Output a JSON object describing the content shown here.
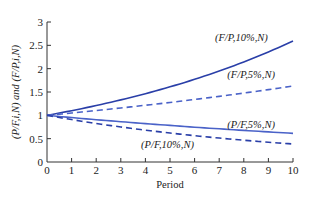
{
  "chart_data": {
    "type": "line",
    "title": "",
    "xlabel": "Period",
    "ylabel": "(P/F,i,N) and (F/P,i,N)",
    "xlim": [
      0,
      10
    ],
    "ylim": [
      0,
      3
    ],
    "grid": false,
    "legend": "inline labels",
    "x_ticks": [
      "0",
      "1",
      "2",
      "3",
      "4",
      "5",
      "6",
      "7",
      "8",
      "9",
      "10"
    ],
    "y_ticks": [
      "0",
      "0.5",
      "1",
      "1.5",
      "2",
      "2.5",
      "3"
    ],
    "x": [
      0,
      1,
      2,
      3,
      4,
      5,
      6,
      7,
      8,
      9,
      10
    ],
    "series": [
      {
        "name": "(F/P,10%,N)",
        "style": "solid",
        "color": "#2a3fa8",
        "values": [
          1.0,
          1.1,
          1.21,
          1.331,
          1.464,
          1.611,
          1.772,
          1.949,
          2.144,
          2.358,
          2.594
        ]
      },
      {
        "name": "(F/P,5%,N)",
        "style": "dashed",
        "color": "#4a62c8",
        "values": [
          1.0,
          1.05,
          1.103,
          1.158,
          1.216,
          1.276,
          1.34,
          1.407,
          1.477,
          1.551,
          1.629
        ]
      },
      {
        "name": "(P/F,5%,N)",
        "style": "solid",
        "color": "#4a62c8",
        "values": [
          1.0,
          0.952,
          0.907,
          0.864,
          0.823,
          0.784,
          0.746,
          0.711,
          0.677,
          0.645,
          0.614
        ]
      },
      {
        "name": "(P/F,10%,N)",
        "style": "dashed",
        "color": "#2a3fa8",
        "values": [
          1.0,
          0.909,
          0.826,
          0.751,
          0.683,
          0.621,
          0.564,
          0.513,
          0.467,
          0.424,
          0.386
        ]
      }
    ],
    "annotations": [
      {
        "text": "(F/P,10%,N)",
        "x": 7.9,
        "y": 2.6
      },
      {
        "text": "(F/P,5%,N)",
        "x": 8.3,
        "y": 1.8
      },
      {
        "text": "(P/F,5%,N)",
        "x": 8.3,
        "y": 0.72
      },
      {
        "text": "(P/F,10%,N)",
        "x": 4.9,
        "y": 0.3
      }
    ]
  }
}
